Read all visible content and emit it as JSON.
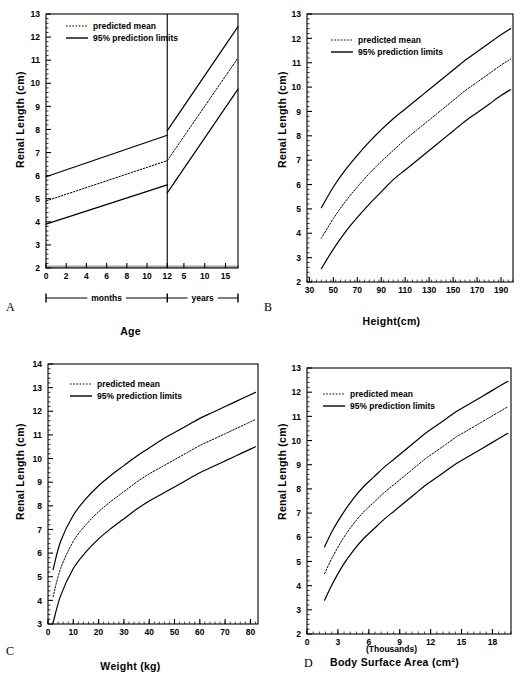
{
  "figure": {
    "legend": {
      "mean_label": "predicted mean",
      "limits_label": "95% prediction limits"
    },
    "ylabel": "Renal Length (cm)",
    "panel_letters": {
      "a": "A",
      "b": "B",
      "c": "C",
      "d": "D"
    }
  },
  "chart_data": [
    {
      "panel": "A",
      "type": "line",
      "title": "",
      "xlabel": "Age",
      "ylabel": "Renal Length (cm)",
      "xlim": [
        0,
        19
      ],
      "ylim": [
        2,
        13
      ],
      "ytick_labels": [
        "2",
        "3",
        "4",
        "5",
        "6",
        "7",
        "8",
        "9",
        "10",
        "11",
        "12",
        "13"
      ],
      "xtick_labels": [
        "0",
        "2",
        "4",
        "6",
        "8",
        "10",
        "12",
        "5",
        "10",
        "15"
      ],
      "x_axis_segments": [
        {
          "label": "months",
          "ticks": [
            0,
            2,
            4,
            6,
            8,
            10,
            12
          ]
        },
        {
          "label": "years",
          "ticks": [
            5,
            10,
            15
          ]
        }
      ],
      "divider_at_months": 12,
      "grid": false,
      "legend_position": "top-left",
      "series": [
        {
          "name": "95% upper prediction limit",
          "style": "solid",
          "x": [
            0,
            12,
            12,
            19
          ],
          "values": [
            5.95,
            7.75,
            7.95,
            12.45
          ]
        },
        {
          "name": "predicted mean",
          "style": "dotted",
          "x": [
            0,
            12,
            12,
            19
          ],
          "values": [
            4.9,
            6.65,
            6.65,
            11.1
          ]
        },
        {
          "name": "95% lower prediction limit",
          "style": "solid",
          "x": [
            0,
            12,
            12,
            19
          ],
          "values": [
            3.9,
            5.6,
            5.25,
            9.75
          ]
        }
      ]
    },
    {
      "panel": "B",
      "type": "line",
      "title": "",
      "xlabel": "Height(cm)",
      "ylabel": "Renal Length (cm)",
      "xlim": [
        28,
        200
      ],
      "ylim": [
        2,
        13
      ],
      "ytick_labels": [
        "2",
        "3",
        "4",
        "5",
        "6",
        "7",
        "8",
        "9",
        "10",
        "11",
        "12",
        "13"
      ],
      "xtick_labels": [
        "30",
        "50",
        "70",
        "90",
        "110",
        "130",
        "150",
        "170",
        "190"
      ],
      "xticks": [
        30,
        50,
        70,
        90,
        110,
        130,
        150,
        170,
        190
      ],
      "grid": false,
      "legend_position": "top-left",
      "x": [
        40,
        50,
        60,
        70,
        80,
        90,
        100,
        110,
        120,
        130,
        140,
        150,
        160,
        170,
        180,
        190,
        198
      ],
      "series": [
        {
          "name": "95% upper prediction limit",
          "style": "solid",
          "values": [
            5.05,
            5.9,
            6.6,
            7.2,
            7.75,
            8.25,
            8.7,
            9.1,
            9.5,
            9.9,
            10.3,
            10.7,
            11.1,
            11.45,
            11.8,
            12.15,
            12.4
          ]
        },
        {
          "name": "predicted mean",
          "style": "dotted",
          "values": [
            3.8,
            4.6,
            5.3,
            5.9,
            6.45,
            6.95,
            7.4,
            7.85,
            8.25,
            8.65,
            9.05,
            9.45,
            9.85,
            10.2,
            10.55,
            10.9,
            11.15
          ]
        },
        {
          "name": "95% lower prediction limit",
          "style": "solid",
          "values": [
            2.55,
            3.35,
            4.05,
            4.65,
            5.2,
            5.7,
            6.2,
            6.6,
            7.0,
            7.4,
            7.8,
            8.2,
            8.6,
            8.95,
            9.3,
            9.65,
            9.9
          ]
        }
      ]
    },
    {
      "panel": "C",
      "type": "line",
      "title": "",
      "xlabel": "Weight (kg)",
      "ylabel": "Renal Length (cm)",
      "xlim": [
        0,
        83
      ],
      "ylim": [
        3,
        14
      ],
      "ytick_labels": [
        "3",
        "4",
        "5",
        "6",
        "7",
        "8",
        "9",
        "10",
        "11",
        "12",
        "13",
        "14"
      ],
      "xtick_labels": [
        "0",
        "10",
        "20",
        "30",
        "40",
        "50",
        "60",
        "70",
        "80"
      ],
      "xticks": [
        0,
        10,
        20,
        30,
        40,
        50,
        60,
        70,
        80
      ],
      "grid": false,
      "legend_position": "top-left",
      "x": [
        2,
        5,
        10,
        15,
        20,
        25,
        30,
        35,
        40,
        45,
        50,
        55,
        60,
        65,
        70,
        75,
        80,
        82
      ],
      "series": [
        {
          "name": "95% upper prediction limit",
          "style": "solid",
          "values": [
            5.3,
            6.5,
            7.6,
            8.3,
            8.85,
            9.3,
            9.7,
            10.1,
            10.45,
            10.8,
            11.1,
            11.4,
            11.7,
            11.95,
            12.2,
            12.45,
            12.7,
            12.8
          ]
        },
        {
          "name": "predicted mean",
          "style": "dotted",
          "values": [
            4.15,
            5.35,
            6.5,
            7.2,
            7.75,
            8.2,
            8.6,
            9.0,
            9.35,
            9.65,
            9.95,
            10.25,
            10.55,
            10.8,
            11.05,
            11.3,
            11.55,
            11.65
          ]
        },
        {
          "name": "95% lower prediction limit",
          "style": "solid",
          "values": [
            3.05,
            4.2,
            5.35,
            6.05,
            6.6,
            7.05,
            7.45,
            7.85,
            8.2,
            8.5,
            8.8,
            9.1,
            9.4,
            9.65,
            9.9,
            10.15,
            10.4,
            10.5
          ]
        }
      ]
    },
    {
      "panel": "D",
      "type": "line",
      "title": "",
      "xlabel": "Body Surface Area (cm²)",
      "xlabel_note": "(Thousands)",
      "ylabel": "Renal Length (cm)",
      "xlim": [
        0,
        19.8
      ],
      "ylim": [
        2,
        13
      ],
      "ytick_labels": [
        "2",
        "3",
        "4",
        "5",
        "6",
        "7",
        "8",
        "9",
        "10",
        "11",
        "12",
        "13"
      ],
      "xtick_labels": [
        "0",
        "3",
        "6",
        "9",
        "12",
        "15",
        "18"
      ],
      "xticks": [
        0,
        3,
        6,
        9,
        12,
        15,
        18
      ],
      "grid": false,
      "legend_position": "top-left",
      "x": [
        1.7,
        2.5,
        3.5,
        4.5,
        5.5,
        6.5,
        7.5,
        8.5,
        9.5,
        10.5,
        11.5,
        12.5,
        13.5,
        14.5,
        15.5,
        16.5,
        17.5,
        18.5,
        19.5
      ],
      "series": [
        {
          "name": "95% upper prediction limit",
          "style": "solid",
          "values": [
            5.6,
            6.3,
            7.0,
            7.6,
            8.1,
            8.5,
            8.9,
            9.25,
            9.6,
            9.95,
            10.3,
            10.6,
            10.9,
            11.2,
            11.45,
            11.7,
            11.95,
            12.2,
            12.45
          ]
        },
        {
          "name": "predicted mean",
          "style": "dotted",
          "values": [
            4.5,
            5.2,
            5.95,
            6.55,
            7.05,
            7.45,
            7.85,
            8.2,
            8.55,
            8.9,
            9.25,
            9.55,
            9.85,
            10.15,
            10.4,
            10.65,
            10.9,
            11.15,
            11.4
          ]
        },
        {
          "name": "95% lower prediction limit",
          "style": "solid",
          "values": [
            3.4,
            4.1,
            4.85,
            5.45,
            5.95,
            6.35,
            6.75,
            7.1,
            7.45,
            7.8,
            8.15,
            8.45,
            8.75,
            9.05,
            9.3,
            9.55,
            9.8,
            10.05,
            10.3
          ]
        }
      ]
    }
  ]
}
